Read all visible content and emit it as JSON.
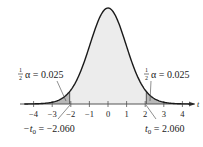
{
  "chart_data": {
    "type": "area",
    "title": "",
    "xlabel": "t",
    "ylabel": "",
    "distribution": "t-distribution (two-tailed)",
    "x_ticks": [
      -4,
      -3,
      -2,
      -1,
      0,
      1,
      2,
      3,
      4
    ],
    "x_tick_labels": [
      "−4",
      "−3",
      "−2",
      "−1",
      "0",
      "1",
      "2",
      "3",
      "4"
    ],
    "xlim": [
      -4.5,
      4.6
    ],
    "critical_values": [
      -2.06,
      2.06
    ],
    "shaded_regions": [
      {
        "from": -4.5,
        "to": -2.06,
        "area": 0.025
      },
      {
        "from": 2.06,
        "to": 4.6,
        "area": 0.025
      }
    ],
    "annotations": [
      {
        "text": "½α = 0.025",
        "position": "left-tail"
      },
      {
        "text": "½α = 0.025",
        "position": "right-tail"
      },
      {
        "text": "−t₀ = −2.060",
        "position": "below-left-critical"
      },
      {
        "text": "t₀ = 2.060",
        "position": "below-right-critical"
      }
    ],
    "grid": false,
    "legend": "none"
  },
  "labels": {
    "axis_var": "t",
    "left_alpha_frac_num": "1",
    "left_alpha_frac_den": "2",
    "left_alpha_text": "α = 0.025",
    "right_alpha_frac_num": "1",
    "right_alpha_frac_den": "2",
    "right_alpha_text": "α = 0.025",
    "neg_t0_prefix": "−t",
    "neg_t0_sub": "0",
    "neg_t0_value": " = −2.060",
    "pos_t0_prefix": "t",
    "pos_t0_sub": "0",
    "pos_t0_value": " = 2.060",
    "ticks": [
      "−4",
      "−3",
      "−2",
      "−1",
      "0",
      "1",
      "2",
      "3",
      "4"
    ]
  },
  "colors": {
    "curve": "#1a1a1a",
    "center_fill": "#ececec",
    "tail_fill": "#b8b8b8",
    "axis": "#555555"
  }
}
